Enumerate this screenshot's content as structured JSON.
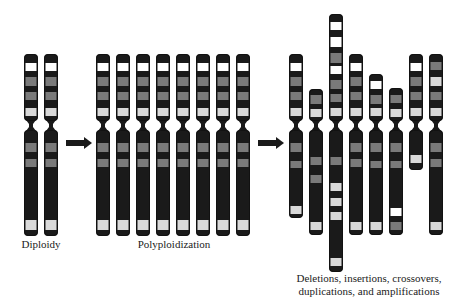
{
  "figure": {
    "colors": {
      "dark": "#1a1a1a",
      "gray": "#7a7a7a",
      "lightgray": "#d9d9d9",
      "white": "#ffffff",
      "outline": "#111111",
      "arrow": "#1a1a1a"
    },
    "chromosome_width": 14,
    "labels": [
      {
        "id": "diploidy",
        "text": "Diploidy",
        "x": 41,
        "y": 238
      },
      {
        "id": "polyploidization",
        "text": "Polyploidization",
        "x": 174,
        "y": 238
      },
      {
        "id": "rearrangements_line1",
        "text": "Deletions, insertions, crossovers,",
        "x": 369,
        "y": 272
      },
      {
        "id": "rearrangements_line2",
        "text": "duplications, and amplifications",
        "x": 369,
        "y": 285
      }
    ],
    "arrows": [
      {
        "id": "arrow-1",
        "x1": 66,
        "x2": 92,
        "y": 143
      },
      {
        "id": "arrow-2",
        "x1": 258,
        "x2": 284,
        "y": 143
      }
    ],
    "groups": [
      {
        "name": "diploid",
        "chromosomes": [
          {
            "x": 24,
            "template": "standard"
          },
          {
            "x": 44,
            "template": "standard"
          }
        ]
      },
      {
        "name": "polyploid",
        "chromosomes": [
          {
            "x": 96,
            "template": "standard"
          },
          {
            "x": 116,
            "template": "standard"
          },
          {
            "x": 136,
            "template": "standard"
          },
          {
            "x": 156,
            "template": "standard"
          },
          {
            "x": 176,
            "template": "standard"
          },
          {
            "x": 196,
            "template": "standard"
          },
          {
            "x": 216,
            "template": "standard"
          },
          {
            "x": 236,
            "template": "standard"
          }
        ]
      },
      {
        "name": "rearranged",
        "chromosomes": [
          {
            "x": 289,
            "top": 54,
            "centromere": [
              121,
              130
            ],
            "bottom": 218,
            "bands": [
              [
                63,
                71,
                "white"
              ],
              [
                77,
                86,
                "gray"
              ],
              [
                92,
                100,
                "gray"
              ],
              [
                108,
                116,
                "lightgray"
              ],
              [
                143,
                152,
                "gray"
              ],
              [
                161,
                168,
                "gray"
              ],
              [
                206,
                214,
                "lightgray"
              ]
            ]
          },
          {
            "x": 309,
            "top": 89,
            "centromere": [
              121,
              130
            ],
            "bottom": 235,
            "bands": [
              [
                95,
                104,
                "gray"
              ],
              [
                109,
                117,
                "lightgray"
              ],
              [
                157,
                165,
                "gray"
              ],
              [
                175,
                183,
                "gray"
              ],
              [
                222,
                230,
                "lightgray"
              ]
            ]
          },
          {
            "x": 329,
            "top": 14,
            "centromere": [
              121,
              130
            ],
            "bottom": 272,
            "bands": [
              [
                22,
                30,
                "white"
              ],
              [
                37,
                47,
                "white"
              ],
              [
                53,
                63,
                "gray"
              ],
              [
                66,
                74,
                "white"
              ],
              [
                80,
                89,
                "gray"
              ],
              [
                94,
                102,
                "gray"
              ],
              [
                108,
                116,
                "lightgray"
              ],
              [
                157,
                165,
                "gray"
              ],
              [
                183,
                191,
                "lightgray"
              ],
              [
                198,
                206,
                "lightgray"
              ],
              [
                212,
                220,
                "lightgray"
              ],
              [
                258,
                266,
                "lightgray"
              ]
            ]
          },
          {
            "x": 349,
            "top": 54,
            "centromere": [
              121,
              130
            ],
            "bottom": 235,
            "bands": [
              [
                63,
                71,
                "white"
              ],
              [
                77,
                86,
                "gray"
              ],
              [
                92,
                100,
                "gray"
              ],
              [
                108,
                116,
                "lightgray"
              ],
              [
                143,
                152,
                "gray"
              ],
              [
                159,
                167,
                "gray"
              ],
              [
                222,
                230,
                "lightgray"
              ]
            ]
          },
          {
            "x": 369,
            "top": 74,
            "centromere": [
              121,
              130
            ],
            "bottom": 235,
            "bands": [
              [
                81,
                89,
                "white"
              ],
              [
                95,
                104,
                "gray"
              ],
              [
                108,
                116,
                "lightgray"
              ],
              [
                143,
                152,
                "gray"
              ],
              [
                161,
                168,
                "gray"
              ],
              [
                222,
                230,
                "lightgray"
              ]
            ]
          },
          {
            "x": 389,
            "top": 88,
            "centromere": [
              121,
              130
            ],
            "bottom": 235,
            "bands": [
              [
                95,
                103,
                "gray"
              ],
              [
                109,
                117,
                "lightgray"
              ],
              [
                143,
                152,
                "gray"
              ],
              [
                161,
                168,
                "gray"
              ],
              [
                208,
                216,
                "white"
              ],
              [
                222,
                230,
                "gray"
              ]
            ]
          },
          {
            "x": 409,
            "top": 54,
            "centromere": [
              121,
              130
            ],
            "bottom": 170,
            "bands": [
              [
                63,
                71,
                "white"
              ],
              [
                77,
                86,
                "gray"
              ],
              [
                92,
                100,
                "gray"
              ],
              [
                108,
                116,
                "lightgray"
              ],
              [
                155,
                163,
                "lightgray"
              ]
            ]
          },
          {
            "x": 429,
            "top": 54,
            "centromere": [
              121,
              130
            ],
            "bottom": 235,
            "bands": [
              [
                62,
                70,
                "gray"
              ],
              [
                77,
                86,
                "lightgray"
              ],
              [
                92,
                100,
                "gray"
              ],
              [
                108,
                116,
                "lightgray"
              ],
              [
                143,
                152,
                "gray"
              ],
              [
                159,
                167,
                "gray"
              ],
              [
                222,
                230,
                "lightgray"
              ]
            ]
          }
        ]
      }
    ],
    "templates": {
      "standard": {
        "top": 54,
        "centromere": [
          121,
          130
        ],
        "bottom": 236,
        "bands": [
          [
            63,
            71,
            "white"
          ],
          [
            77,
            86,
            "gray"
          ],
          [
            92,
            100,
            "gray"
          ],
          [
            108,
            116,
            "lightgray"
          ],
          [
            143,
            152,
            "gray"
          ],
          [
            159,
            167,
            "gray"
          ],
          [
            220,
            230,
            "lightgray"
          ]
        ]
      }
    }
  }
}
